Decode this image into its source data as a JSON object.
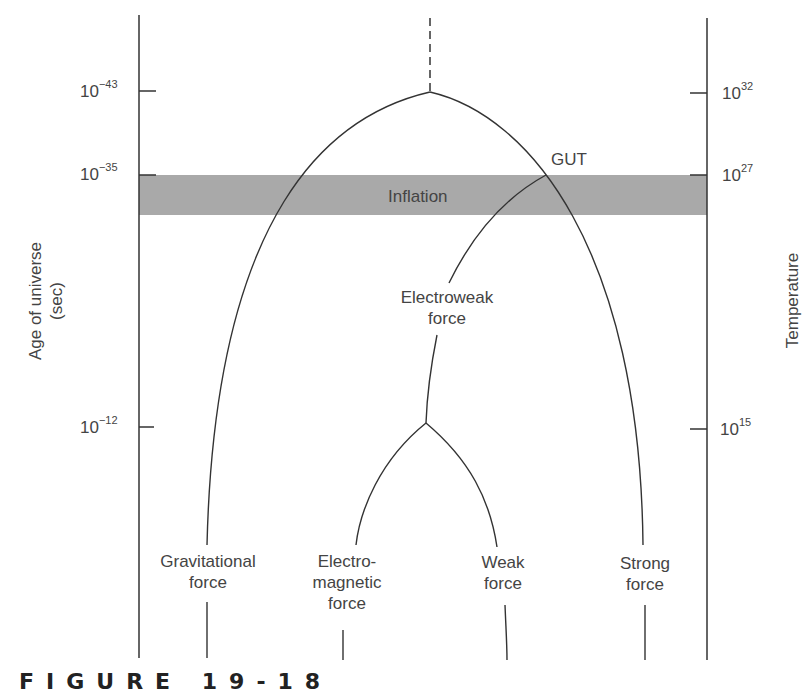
{
  "figure": {
    "caption": "FIGURE 19-18",
    "band_label": "Inflation",
    "gut_label": "GUT",
    "electroweak_label": [
      "Electroweak",
      "force"
    ],
    "left_axis": {
      "title": [
        "Age of universe",
        "(sec)"
      ],
      "ticks": [
        {
          "base": "10",
          "exp": "−43"
        },
        {
          "base": "10",
          "exp": "−35"
        },
        {
          "base": "10",
          "exp": "−12"
        }
      ]
    },
    "right_axis": {
      "title": "Temperature",
      "ticks": [
        {
          "base": "10",
          "exp": "32"
        },
        {
          "base": "10",
          "exp": "27"
        },
        {
          "base": "10",
          "exp": "15"
        }
      ]
    },
    "forces": [
      {
        "lines": [
          "Gravitational",
          "force"
        ]
      },
      {
        "lines": [
          "Electro-",
          "magnetic",
          "force"
        ]
      },
      {
        "lines": [
          "Weak",
          "force"
        ]
      },
      {
        "lines": [
          "Strong",
          "force"
        ]
      }
    ],
    "colors": {
      "band": "#a9a9a9",
      "line": "#333333"
    }
  }
}
